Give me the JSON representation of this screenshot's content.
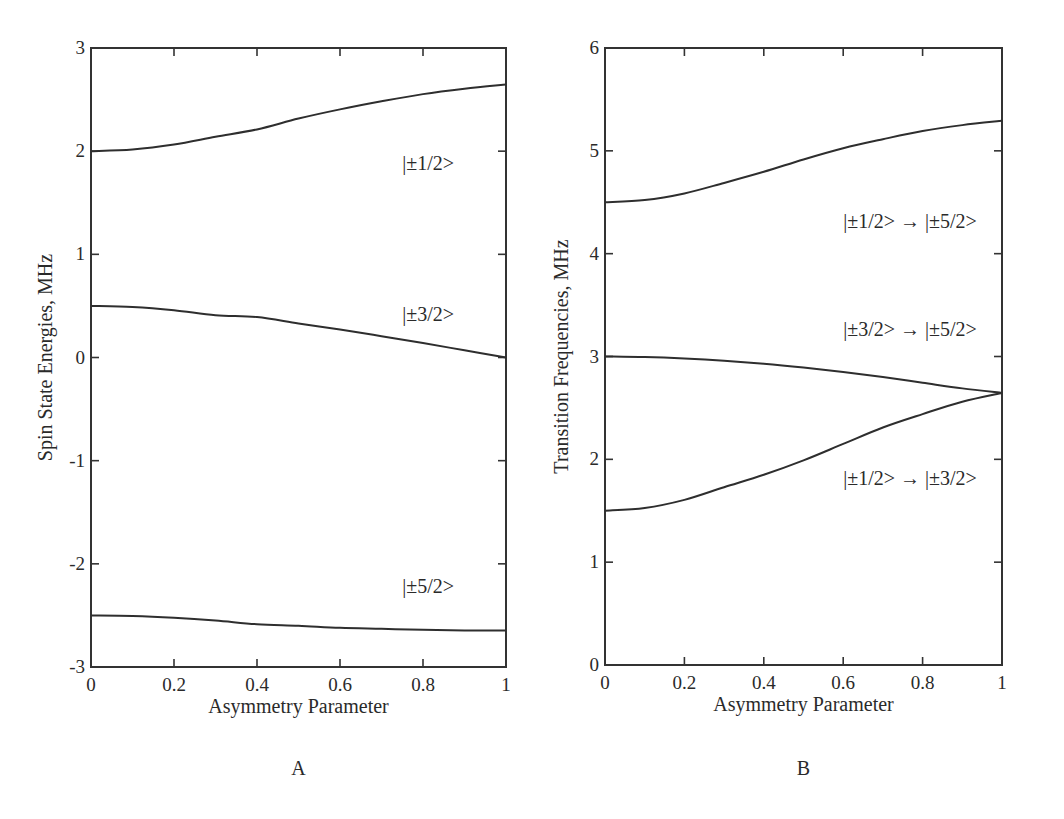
{
  "chart_data": [
    {
      "type": "line",
      "panel_label": "A",
      "title": "",
      "xlabel": "Asymmetry Parameter",
      "ylabel": "Spin State Energies, MHz",
      "xlim": [
        0,
        1
      ],
      "ylim": [
        -3,
        3
      ],
      "xticks": [
        0,
        0.2,
        0.4,
        0.6,
        0.8,
        1
      ],
      "xtick_labels": [
        "0",
        "0.2",
        "0.4",
        "0.6",
        "0.8",
        "1"
      ],
      "yticks": [
        -3,
        -2,
        -1,
        0,
        1,
        2,
        3
      ],
      "ytick_labels": [
        "-3",
        "-2",
        "-1",
        "0",
        "1",
        "2",
        "3"
      ],
      "grid": false,
      "x": [
        0,
        0.1,
        0.2,
        0.3,
        0.4,
        0.5,
        0.6,
        0.7,
        0.8,
        0.9,
        1.0
      ],
      "series": [
        {
          "name": "|±1/2>",
          "label_pos": [
            0.75,
            1.82
          ],
          "values": [
            2.0,
            2.016,
            2.064,
            2.139,
            2.211,
            2.316,
            2.405,
            2.483,
            2.553,
            2.605,
            2.646
          ]
        },
        {
          "name": "|±3/2>",
          "label_pos": [
            0.75,
            0.35
          ],
          "values": [
            0.5,
            0.489,
            0.458,
            0.41,
            0.392,
            0.33,
            0.272,
            0.207,
            0.14,
            0.07,
            0.0
          ]
        },
        {
          "name": "|±5/2>",
          "label_pos": [
            0.75,
            -2.28
          ],
          "values": [
            -2.5,
            -2.505,
            -2.522,
            -2.549,
            -2.585,
            -2.6,
            -2.62,
            -2.63,
            -2.64,
            -2.645,
            -2.646
          ]
        }
      ]
    },
    {
      "type": "line",
      "panel_label": "B",
      "title": "",
      "xlabel": "Asymmetry Parameter",
      "ylabel": "Transition Frequencies, MHz",
      "xlim": [
        0,
        1
      ],
      "ylim": [
        0,
        6
      ],
      "xticks": [
        0,
        0.2,
        0.4,
        0.6,
        0.8,
        1
      ],
      "xtick_labels": [
        "0",
        "0.2",
        "0.4",
        "0.6",
        "0.8",
        "1"
      ],
      "yticks": [
        0,
        1,
        2,
        3,
        4,
        5,
        6
      ],
      "ytick_labels": [
        "0",
        "1",
        "2",
        "3",
        "4",
        "5",
        "6"
      ],
      "grid": false,
      "x": [
        0,
        0.1,
        0.2,
        0.3,
        0.4,
        0.5,
        0.6,
        0.7,
        0.8,
        0.9,
        1.0
      ],
      "series": [
        {
          "name": "|±1/2> → |±5/2>",
          "label_pos": [
            0.6,
            4.25
          ],
          "values": [
            4.5,
            4.521,
            4.586,
            4.688,
            4.796,
            4.916,
            5.025,
            5.113,
            5.193,
            5.25,
            5.292
          ]
        },
        {
          "name": "|±3/2> → |±5/2>",
          "label_pos": [
            0.6,
            3.2
          ],
          "values": [
            3.0,
            2.994,
            2.98,
            2.959,
            2.93,
            2.893,
            2.85,
            2.8,
            2.745,
            2.69,
            2.646
          ]
        },
        {
          "name": "|±1/2> → |±3/2>",
          "label_pos": [
            0.6,
            1.75
          ],
          "values": [
            1.5,
            1.527,
            1.606,
            1.729,
            1.85,
            1.99,
            2.15,
            2.31,
            2.44,
            2.56,
            2.646
          ]
        }
      ]
    }
  ]
}
